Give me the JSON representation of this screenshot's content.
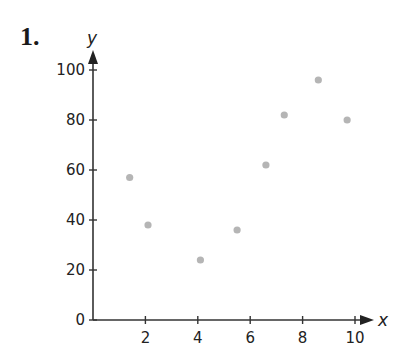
{
  "problem": {
    "number": "1."
  },
  "chart_data": {
    "type": "scatter",
    "title": "",
    "xlabel": "x",
    "ylabel": "y",
    "xlim": [
      0,
      10
    ],
    "ylim": [
      0,
      100
    ],
    "x_ticks": [
      2,
      4,
      6,
      8,
      10
    ],
    "y_ticks": [
      0,
      20,
      40,
      60,
      80,
      100
    ],
    "grid": false,
    "legend": null,
    "point_color": "#b5b5b5",
    "series": [
      {
        "name": "data",
        "points": [
          {
            "x": 1.4,
            "y": 57
          },
          {
            "x": 2.1,
            "y": 38
          },
          {
            "x": 4.1,
            "y": 24
          },
          {
            "x": 5.5,
            "y": 36
          },
          {
            "x": 6.6,
            "y": 62
          },
          {
            "x": 7.3,
            "y": 82
          },
          {
            "x": 8.6,
            "y": 96
          },
          {
            "x": 9.7,
            "y": 80
          }
        ]
      }
    ]
  }
}
